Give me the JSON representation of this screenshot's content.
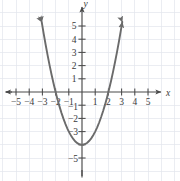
{
  "figure": {
    "kind": "cartesian-graph",
    "width": 180,
    "height": 181,
    "background": "#ffffff"
  },
  "colors": {
    "grid": "#e3e6ec",
    "axis": "#4a4a4a",
    "curve": "#6b6b6b",
    "label": "#3a3a3a"
  },
  "axes": {
    "x_label": "x",
    "y_label": "y",
    "origin_px": {
      "x": 82,
      "y": 92
    },
    "unit_px": {
      "x": 13.2,
      "y": 13.2
    },
    "xlim": [
      -6.2,
      7.4
    ],
    "ylim": [
      -6.7,
      7.0
    ],
    "grid": true,
    "arrowheads": [
      "left",
      "right",
      "up",
      "down"
    ],
    "x_ticks": [
      -5,
      -4,
      -3,
      -2,
      -1,
      1,
      2,
      3,
      4,
      5
    ],
    "y_ticks": [
      5,
      4,
      3,
      2,
      1,
      -1,
      -2,
      -3,
      -5
    ],
    "x_tick_labels": [
      "−5",
      "−4",
      "−3",
      "−2",
      "−1",
      "1",
      "2",
      "3",
      "4",
      "5"
    ],
    "y_tick_labels": [
      "5",
      "4",
      "3",
      "2",
      "1",
      "−1",
      "−2",
      "−3",
      "−5"
    ],
    "hidden_y_tick_labels": [
      -4
    ]
  },
  "chart_data": {
    "type": "line",
    "title": "",
    "subtitle": "",
    "xlabel": "x",
    "ylabel": "y",
    "xlim": [
      -6.2,
      7.4
    ],
    "ylim": [
      -6.7,
      7.0
    ],
    "grid": true,
    "legend": null,
    "series": [
      {
        "name": "y = x^2 - 4",
        "equation": "y = x² − 4",
        "shape": "parabola",
        "opens": "up",
        "vertex": [
          0,
          -4
        ],
        "roots": [
          -2,
          2
        ],
        "y_intercept": -4,
        "color": "#6b6b6b",
        "arrow_ends": "both",
        "x": [
          -3.05,
          -2.9,
          -2.75,
          -2.6,
          -2.45,
          -2.3,
          -2.15,
          -2.0,
          -1.85,
          -1.7,
          -1.55,
          -1.4,
          -1.25,
          -1.1,
          -0.95,
          -0.8,
          -0.65,
          -0.5,
          -0.35,
          -0.2,
          -0.05,
          0.1,
          0.25,
          0.4,
          0.55,
          0.7,
          0.85,
          1.0,
          1.15,
          1.3,
          1.45,
          1.6,
          1.75,
          1.9,
          2.05,
          2.2,
          2.35,
          2.5,
          2.65,
          2.8,
          2.95,
          3.05
        ],
        "y": [
          5.3,
          4.41,
          3.5625,
          2.76,
          2.0025,
          1.29,
          0.6225,
          0.0,
          -0.5775,
          -1.11,
          -1.5975,
          -2.04,
          -2.4375,
          -2.79,
          -3.0975,
          -3.36,
          -3.5775,
          -3.75,
          -3.8775,
          -3.96,
          -3.9975,
          -3.99,
          -3.9375,
          -3.84,
          -3.6975,
          -3.51,
          -3.2775,
          -3.0,
          -2.6775,
          -2.31,
          -1.8975,
          -1.44,
          -0.9375,
          -0.39,
          0.2025,
          0.84,
          1.5225,
          2.25,
          3.0225,
          3.84,
          4.7025,
          5.3
        ]
      }
    ]
  }
}
